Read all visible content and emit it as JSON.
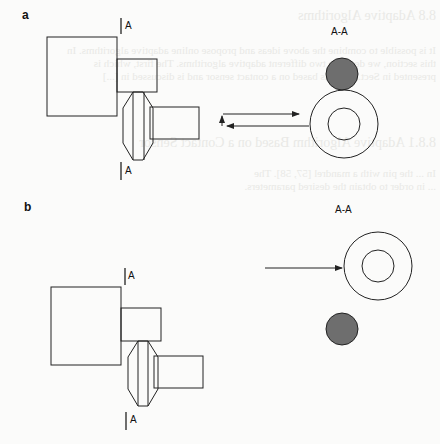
{
  "figure": {
    "panels": [
      {
        "id": "a",
        "label": "a",
        "section_marker_top": "A",
        "section_marker_bottom": "A",
        "section_view_title": "A-A"
      },
      {
        "id": "b",
        "label": "b",
        "section_marker_top": "A",
        "section_marker_bottom": "A",
        "section_view_title": "A-A"
      }
    ],
    "colors": {
      "stroke": "#222222",
      "filled_disc": "#6e6e6e",
      "background": "#fbfbfa"
    }
  },
  "bleed_through_text": [
    "8.8  Adaptive Algorithms",
    "It is possible to combine the above ideas and propose online adaptive algorithms. In",
    "this section, we describe two different adaptive algorithms. The first, which is",
    "presented in Sect. 8.8.1, is based on a contact sensor and is discussed in [...]",
    "8.8.1  Adaptive Algorithm Based on a Contact Sensor",
    "In ... the pin with a mandrel [57, 58]. The",
    "... in order to obtain the desired parameters."
  ]
}
